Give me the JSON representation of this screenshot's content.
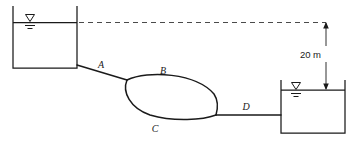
{
  "figure": {
    "diagram_type": "hydraulics-schematic",
    "ink_color": "#1a1a1a",
    "background_color": "#ffffff",
    "dashed_line_color": "#4a4a4a"
  },
  "labels": {
    "pipe_a": "A",
    "pipe_b": "B",
    "pipe_c": "C",
    "pipe_d": "D"
  },
  "dimension": {
    "value": "20 m",
    "quantity": "20",
    "unit": "m",
    "description": "elevation difference between reservoir water surfaces"
  },
  "reservoirs": [
    {
      "name": "upper-reservoir",
      "position": "left",
      "water_surface_symbol": "water-level-triangle"
    },
    {
      "name": "lower-reservoir",
      "position": "right",
      "water_surface_symbol": "water-level-triangle"
    }
  ],
  "icons": {
    "water_level": "water-level-icon",
    "arrow_up": "arrow-up-icon",
    "arrow_down": "arrow-down-icon"
  }
}
